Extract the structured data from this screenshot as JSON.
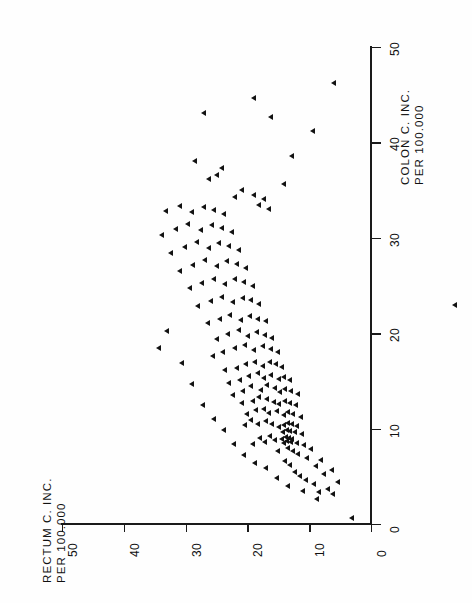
{
  "chart_data": {
    "type": "scatter",
    "title": "",
    "orientation": "rotated-90",
    "xlabel": "RECTUM C. INC. PER 100.000",
    "ylabel": "COLON C. INC. PER 100.000",
    "xlabel_lines": [
      "RECTUM C. INC.",
      "PER 100.000"
    ],
    "ylabel_lines": [
      "COLON C. INC.",
      "PER 100.000"
    ],
    "xlim": [
      0,
      50
    ],
    "ylim": [
      0,
      50
    ],
    "xticks": [
      0,
      10,
      20,
      30,
      40,
      50
    ],
    "yticks": [
      0,
      10,
      20,
      30,
      40,
      50
    ],
    "xticklabels": [
      "0",
      "10",
      "20",
      "30",
      "40",
      "50"
    ],
    "yticklabels": [
      "0",
      "10",
      "20",
      "30",
      "40",
      "50"
    ],
    "grid": false,
    "legend": null,
    "marker": "left-triangle",
    "marker_color": "#121212",
    "series": [
      {
        "name": "countries",
        "points": [
          [
            3.2,
            0.6
          ],
          [
            6.2,
            3.1
          ],
          [
            7.0,
            3.6
          ],
          [
            8.4,
            3.3
          ],
          [
            5.4,
            4.4
          ],
          [
            9.3,
            4.2
          ],
          [
            10.6,
            4.6
          ],
          [
            7.6,
            5.2
          ],
          [
            11.5,
            5.0
          ],
          [
            6.4,
            5.6
          ],
          [
            12.4,
            5.4
          ],
          [
            9.0,
            6.0
          ],
          [
            13.1,
            6.2
          ],
          [
            8.1,
            6.7
          ],
          [
            10.4,
            6.9
          ],
          [
            14.0,
            6.6
          ],
          [
            11.8,
            7.3
          ],
          [
            12.6,
            7.6
          ],
          [
            9.7,
            7.8
          ],
          [
            13.4,
            7.9
          ],
          [
            15.1,
            7.6
          ],
          [
            10.9,
            8.3
          ],
          [
            12.1,
            8.5
          ],
          [
            13.0,
            8.6
          ],
          [
            13.6,
            8.7
          ],
          [
            14.2,
            8.5
          ],
          [
            12.8,
            8.9
          ],
          [
            13.3,
            9.0
          ],
          [
            13.8,
            9.1
          ],
          [
            14.4,
            8.9
          ],
          [
            15.6,
            8.8
          ],
          [
            11.2,
            9.4
          ],
          [
            12.4,
            9.6
          ],
          [
            13.1,
            9.7
          ],
          [
            13.7,
            9.8
          ],
          [
            14.3,
            9.6
          ],
          [
            16.4,
            9.2
          ],
          [
            17.2,
            8.6
          ],
          [
            18.0,
            9.0
          ],
          [
            19.1,
            8.4
          ],
          [
            12.0,
            10.2
          ],
          [
            12.9,
            10.4
          ],
          [
            13.5,
            10.6
          ],
          [
            14.1,
            10.3
          ],
          [
            15.0,
            10.1
          ],
          [
            16.1,
            10.5
          ],
          [
            17.0,
            10.8
          ],
          [
            18.3,
            10.4
          ],
          [
            19.5,
            10.9
          ],
          [
            20.4,
            10.3
          ],
          [
            11.4,
            11.2
          ],
          [
            12.6,
            11.5
          ],
          [
            13.4,
            11.7
          ],
          [
            14.2,
            11.4
          ],
          [
            15.3,
            11.8
          ],
          [
            16.6,
            11.6
          ],
          [
            17.4,
            12.0
          ],
          [
            18.6,
            11.9
          ],
          [
            20.1,
            11.5
          ],
          [
            12.2,
            12.4
          ],
          [
            13.1,
            12.7
          ],
          [
            14.0,
            12.9
          ],
          [
            14.9,
            12.5
          ],
          [
            15.8,
            12.8
          ],
          [
            16.9,
            13.1
          ],
          [
            18.1,
            13.3
          ],
          [
            19.2,
            12.9
          ],
          [
            21.0,
            12.6
          ],
          [
            11.9,
            13.6
          ],
          [
            13.0,
            13.9
          ],
          [
            13.9,
            14.1
          ],
          [
            14.7,
            13.8
          ],
          [
            15.6,
            14.2
          ],
          [
            16.8,
            14.5
          ],
          [
            17.9,
            14.0
          ],
          [
            19.4,
            14.4
          ],
          [
            20.8,
            13.9
          ],
          [
            22.3,
            13.5
          ],
          [
            13.2,
            15.1
          ],
          [
            14.1,
            15.4
          ],
          [
            15.0,
            15.2
          ],
          [
            16.2,
            15.6
          ],
          [
            17.3,
            15.3
          ],
          [
            18.4,
            15.8
          ],
          [
            19.8,
            15.5
          ],
          [
            21.3,
            15.1
          ],
          [
            23.0,
            14.8
          ],
          [
            14.4,
            16.4
          ],
          [
            15.4,
            16.7
          ],
          [
            16.4,
            16.9
          ],
          [
            17.6,
            16.5
          ],
          [
            18.8,
            17.0
          ],
          [
            20.2,
            16.7
          ],
          [
            21.8,
            16.3
          ],
          [
            23.6,
            16.1
          ],
          [
            15.1,
            18.0
          ],
          [
            16.3,
            18.3
          ],
          [
            17.5,
            18.6
          ],
          [
            18.9,
            18.2
          ],
          [
            20.5,
            18.7
          ],
          [
            22.1,
            18.4
          ],
          [
            24.0,
            18.0
          ],
          [
            25.6,
            17.6
          ],
          [
            16.0,
            19.5
          ],
          [
            17.2,
            19.8
          ],
          [
            18.5,
            20.1
          ],
          [
            19.9,
            19.7
          ],
          [
            21.4,
            20.3
          ],
          [
            23.2,
            19.9
          ],
          [
            25.0,
            19.4
          ],
          [
            17.0,
            21.2
          ],
          [
            18.3,
            21.5
          ],
          [
            19.6,
            21.8
          ],
          [
            21.1,
            21.4
          ],
          [
            22.8,
            21.9
          ],
          [
            24.5,
            21.5
          ],
          [
            26.4,
            21.0
          ],
          [
            18.1,
            23.0
          ],
          [
            19.4,
            23.4
          ],
          [
            20.8,
            23.7
          ],
          [
            22.4,
            23.2
          ],
          [
            24.1,
            23.8
          ],
          [
            26.0,
            23.3
          ],
          [
            28.0,
            22.8
          ],
          [
            19.2,
            24.9
          ],
          [
            20.6,
            25.3
          ],
          [
            22.0,
            25.6
          ],
          [
            23.7,
            25.1
          ],
          [
            25.5,
            25.7
          ],
          [
            27.4,
            25.2
          ],
          [
            29.3,
            24.7
          ],
          [
            20.3,
            26.8
          ],
          [
            21.8,
            27.2
          ],
          [
            23.3,
            27.5
          ],
          [
            25.0,
            27.0
          ],
          [
            26.9,
            27.6
          ],
          [
            28.8,
            27.1
          ],
          [
            31.0,
            26.5
          ],
          [
            21.4,
            28.7
          ],
          [
            23.0,
            29.1
          ],
          [
            24.6,
            29.4
          ],
          [
            26.3,
            28.9
          ],
          [
            28.2,
            29.5
          ],
          [
            30.2,
            29.0
          ],
          [
            32.4,
            28.4
          ],
          [
            22.6,
            30.6
          ],
          [
            24.2,
            31.0
          ],
          [
            25.8,
            31.3
          ],
          [
            27.6,
            30.8
          ],
          [
            29.6,
            31.4
          ],
          [
            31.6,
            30.9
          ],
          [
            33.8,
            30.3
          ],
          [
            23.8,
            32.5
          ],
          [
            25.4,
            32.9
          ],
          [
            27.1,
            33.2
          ],
          [
            29.0,
            32.7
          ],
          [
            31.0,
            33.3
          ],
          [
            33.2,
            32.8
          ],
          [
            16.6,
            33.0
          ],
          [
            17.4,
            34.0
          ],
          [
            18.2,
            33.4
          ],
          [
            19.0,
            34.5
          ],
          [
            14.2,
            35.6
          ],
          [
            21.0,
            35.0
          ],
          [
            22.0,
            34.2
          ],
          [
            25.0,
            36.6
          ],
          [
            26.2,
            36.1
          ],
          [
            24.1,
            37.3
          ],
          [
            12.8,
            38.5
          ],
          [
            28.5,
            38.0
          ],
          [
            9.4,
            41.2
          ],
          [
            16.2,
            42.6
          ],
          [
            19.0,
            44.6
          ],
          [
            27.0,
            43.0
          ],
          [
            6.0,
            46.2
          ],
          [
            33.0,
            20.2
          ],
          [
            34.4,
            18.4
          ],
          [
            30.6,
            16.8
          ],
          [
            29.0,
            14.6
          ],
          [
            27.2,
            12.4
          ],
          [
            25.4,
            11.0
          ],
          [
            23.8,
            9.8
          ],
          [
            22.2,
            8.4
          ],
          [
            20.6,
            7.2
          ],
          [
            18.8,
            6.4
          ],
          [
            17.0,
            5.8
          ],
          [
            15.2,
            4.8
          ],
          [
            13.4,
            4.0
          ],
          [
            11.0,
            3.4
          ],
          [
            8.8,
            2.6
          ]
        ]
      }
    ],
    "stray_marker": {
      "note": "isolated marker right of axis",
      "px": [
        455,
        305
      ]
    }
  },
  "geometry": {
    "origin_px": [
      371,
      524
    ],
    "x_px_per_unit": -6.18,
    "y_px_per_unit": -9.54
  }
}
